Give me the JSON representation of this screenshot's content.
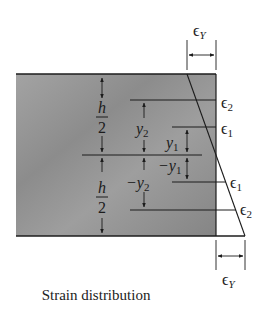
{
  "figure": {
    "caption": "Strain distribution",
    "labels": {
      "eps_y_top": "ϵ",
      "eps_y_top_sub": "Y",
      "eps_y_bottom": "ϵ",
      "eps_y_bottom_sub": "Y",
      "eps2_top": "ϵ",
      "eps2_top_sub": "2",
      "eps1_top": "ϵ",
      "eps1_top_sub": "1",
      "eps1_bottom": "ϵ",
      "eps1_bottom_sub": "1",
      "eps2_bottom": "ϵ",
      "eps2_bottom_sub": "2",
      "h_top_num": "h",
      "h_top_den": "2",
      "h_bot_num": "h",
      "h_bot_den": "2",
      "y2": "y",
      "y2_sub": "2",
      "y1": "y",
      "y1_sub": "1",
      "neg_y1": "−y",
      "neg_y1_sub": "1",
      "neg_y2": "−y",
      "neg_y2_sub": "2"
    },
    "colors": {
      "section_fill": "#9a9a9a",
      "line": "#1c1c1c",
      "background": "#ffffff"
    }
  }
}
